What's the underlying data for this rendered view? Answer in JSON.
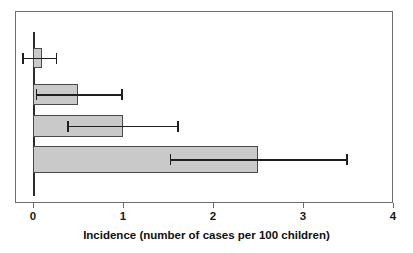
{
  "chart_data": {
    "type": "bar",
    "orientation": "horizontal",
    "title": "",
    "subtitle": "",
    "xlabel": "Incidence (number of cases per 100 children)",
    "ylabel": "",
    "xlim": [
      0,
      4
    ],
    "xticks": [
      0,
      1,
      2,
      3,
      4
    ],
    "xtick_labels": [
      "0",
      "1",
      "2",
      "3",
      "4"
    ],
    "grid": false,
    "legend": null,
    "categories": [
      "Group 1",
      "Group 2",
      "Group 3",
      "Group 4"
    ],
    "values": [
      0.1,
      0.5,
      1.0,
      2.5
    ],
    "error_low": [
      -0.12,
      0.03,
      0.38,
      1.52
    ],
    "error_high": [
      0.27,
      1.0,
      1.62,
      3.5
    ],
    "bar_fill_color": "#c9c9c9",
    "bar_edge_color": "#4a4a4a",
    "error_bar_color": "#1f1f1f",
    "axis_color": "#6d6d6d",
    "background_color": "#ffffff",
    "annotations": []
  },
  "axis": {
    "x_label": "Incidence (number of cases per 100 children)",
    "tick_0": "0",
    "tick_1": "1",
    "tick_2": "2",
    "tick_3": "3",
    "tick_4": "4"
  }
}
